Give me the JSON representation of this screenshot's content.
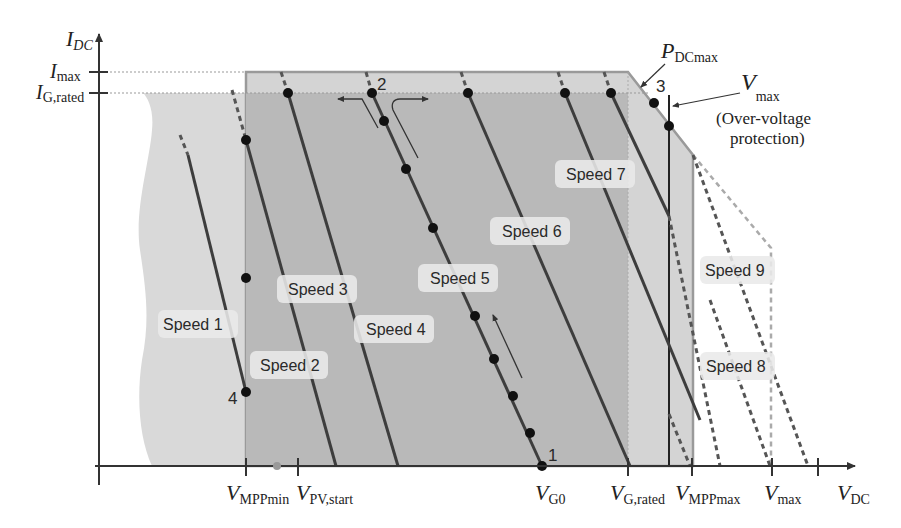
{
  "figure": {
    "type": "operating-region diagram (I-V plane)",
    "axes": {
      "y_label": {
        "main": "I",
        "sub": "DC"
      },
      "x_label": {
        "main": "V",
        "sub": "DC"
      },
      "y_ticks": [
        {
          "main": "I",
          "sub": "max"
        },
        {
          "main": "I",
          "sub": "G,rated"
        }
      ],
      "x_ticks": [
        {
          "main": "V",
          "sub": "MPPmin"
        },
        {
          "main": "V",
          "sub": "PV,start"
        },
        {
          "main": "V",
          "sub": "G0"
        },
        {
          "main": "V",
          "sub": "G,rated"
        },
        {
          "main": "V",
          "sub": "MPPmax"
        },
        {
          "main": "V",
          "sub": "max"
        }
      ]
    },
    "annotations": {
      "pdc_max": {
        "main": "P",
        "sub": "DCmax"
      },
      "vmax_label": {
        "main": "V",
        "sub": "max"
      },
      "vmax_note_line1": "(Over-voltage",
      "vmax_note_line2": "protection)"
    },
    "points": [
      "1",
      "2",
      "3",
      "4"
    ],
    "speed_labels": [
      "Speed 1",
      "Speed 2",
      "Speed 3",
      "Speed 4",
      "Speed 5",
      "Speed 6",
      "Speed 7",
      "Speed 8",
      "Speed 9"
    ],
    "colors": {
      "pv_region": "#d6d6d6",
      "inverter_region": "#c9c9c9",
      "core_region": "#b5b5b5",
      "lines": "#3d3d3d",
      "axis": "#333333",
      "dashed_outline": "#9a9a9a"
    }
  }
}
